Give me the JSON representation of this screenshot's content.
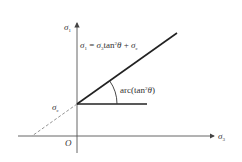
{
  "diagram": {
    "type": "mohr-coulomb-strength-line",
    "axes": {
      "x_label": "σ",
      "x_sub": "3",
      "y_label": "σ",
      "y_sub": "1",
      "origin_label": "O"
    },
    "intercept": {
      "label": "σ",
      "sub": "c"
    },
    "equation": {
      "lhs": "σ",
      "lhs_sub": "1",
      "eq": " = ",
      "term1": "σ",
      "term1_sub": "3",
      "tan": "tan",
      "sup": "2",
      "theta": "θ",
      "plus": " + ",
      "term2": "σ",
      "term2_sub": "c"
    },
    "angle_label": {
      "prefix": "arc(tan",
      "sup": "2",
      "theta": "θ",
      "suffix": ")"
    },
    "colors": {
      "axis": "#555555",
      "line": "#222222",
      "dashed": "#888888",
      "text": "#333333"
    }
  }
}
